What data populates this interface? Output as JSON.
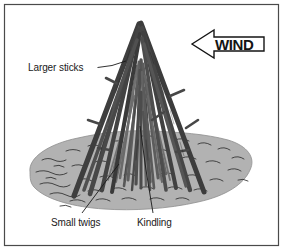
{
  "figure": {
    "border_color": "#4a4a4a",
    "background_color": "#ffffff"
  },
  "ground": {
    "name": "ground-patch",
    "fill_color": "#b2b2b2",
    "outline_color": "#8d8d8d",
    "texture_line_color": "#2e2e2e"
  },
  "fire_structure": {
    "name": "teepee-fire-stack",
    "stick_dark_color": "#3b3b3b",
    "stick_mid_color": "#5a5a5a",
    "stick_light_color": "#7b7b7b"
  },
  "callouts": [
    {
      "id": "larger-sticks",
      "label": "Larger sticks",
      "text_x": 28,
      "text_y": 71,
      "leader": "M 97.5,67.5 L 112,65.5 L 126,61"
    },
    {
      "id": "small-twigs",
      "label": "Small twigs",
      "text_x": 51,
      "text_y": 226,
      "leader": "M 82,213 L 100,189 L 119,164"
    },
    {
      "id": "kindling",
      "label": "Kindling",
      "text_x": 137,
      "text_y": 226,
      "leader": "M 153,213 L 146,170 L 140,126"
    }
  ],
  "wind_arrow": {
    "id": "wind-arrow",
    "label": "WIND",
    "direction": "left",
    "text_x": 215,
    "text_y": 50,
    "outline_color": "#141414",
    "fill_color": "#ffffff"
  }
}
